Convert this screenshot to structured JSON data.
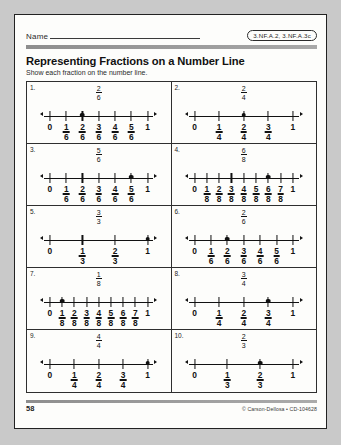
{
  "header": {
    "name_label": "Name",
    "standard_code": "3.NF.A.2, 3.NF.A.3c",
    "title": "Representing Fractions on a Number Line",
    "subtitle": "Show each fraction on the number line."
  },
  "footer": {
    "page_number": "58",
    "credit": "© Carson-Dellosa • CD-104628"
  },
  "problems": [
    {
      "number": "1.",
      "fraction": {
        "numerator": "2",
        "denominator": "6"
      },
      "denominator": 6,
      "marked": 2,
      "labels": [
        "0",
        "1/6",
        "2/6",
        "3/6",
        "4/6",
        "5/6",
        "1"
      ]
    },
    {
      "number": "2.",
      "fraction": {
        "numerator": "2",
        "denominator": "4"
      },
      "denominator": 4,
      "marked": 2,
      "labels": [
        "0",
        "1/4",
        "2/4",
        "3/4",
        "1"
      ]
    },
    {
      "number": "3.",
      "fraction": {
        "numerator": "5",
        "denominator": "6"
      },
      "denominator": 6,
      "marked": 5,
      "labels": [
        "0",
        "1/6",
        "2/6",
        "3/6",
        "4/6",
        "5/6",
        "1"
      ]
    },
    {
      "number": "4.",
      "fraction": {
        "numerator": "6",
        "denominator": "8"
      },
      "denominator": 8,
      "marked": 6,
      "labels": [
        "0",
        "1/8",
        "2/8",
        "3/8",
        "4/8",
        "5/8",
        "6/8",
        "7/8",
        "1"
      ]
    },
    {
      "number": "5.",
      "fraction": {
        "numerator": "3",
        "denominator": "3"
      },
      "denominator": 3,
      "marked": 3,
      "labels": [
        "0",
        "1/3",
        "2/3",
        "1"
      ]
    },
    {
      "number": "6.",
      "fraction": {
        "numerator": "2",
        "denominator": "6"
      },
      "denominator": 6,
      "marked": 2,
      "labels": [
        "0",
        "1/6",
        "2/6",
        "3/6",
        "4/6",
        "5/6",
        "1"
      ]
    },
    {
      "number": "7.",
      "fraction": {
        "numerator": "1",
        "denominator": "8"
      },
      "denominator": 8,
      "marked": 1,
      "labels": [
        "0",
        "1/8",
        "2/8",
        "3/8",
        "4/8",
        "5/8",
        "6/8",
        "7/8",
        "1"
      ]
    },
    {
      "number": "8.",
      "fraction": {
        "numerator": "3",
        "denominator": "4"
      },
      "denominator": 4,
      "marked": 3,
      "labels": [
        "0",
        "1/4",
        "2/4",
        "3/4",
        "1"
      ]
    },
    {
      "number": "9.",
      "fraction": {
        "numerator": "4",
        "denominator": "4"
      },
      "denominator": 4,
      "marked": 4,
      "labels": [
        "0",
        "1/4",
        "2/4",
        "3/4",
        "1"
      ]
    },
    {
      "number": "10.",
      "fraction": {
        "numerator": "2",
        "denominator": "3"
      },
      "denominator": 3,
      "marked": 2,
      "labels": [
        "0",
        "1/3",
        "2/3",
        "1"
      ]
    }
  ]
}
